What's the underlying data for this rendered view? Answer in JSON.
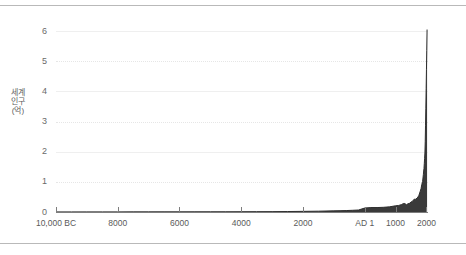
{
  "chart_data": {
    "type": "area",
    "title": "",
    "subtitle": "",
    "xlabel": "",
    "ylabel": "세계인구(억)",
    "xlim": [
      -10000,
      2050
    ],
    "ylim": [
      0,
      6.3
    ],
    "grid": true,
    "legend": "none",
    "fill_color": "#3a3a3a",
    "line_color": "#2f2f2f",
    "gridline_solid_color": "#efefef",
    "gridline_dotted_color": "#e6e6e6",
    "axis_color": "#7d7d7d",
    "y_ticks": [
      {
        "value": 0,
        "label": "0",
        "style": "none"
      },
      {
        "value": 1,
        "label": "1",
        "style": "dotted"
      },
      {
        "value": 2,
        "label": "2",
        "style": "solid"
      },
      {
        "value": 3,
        "label": "3",
        "style": "dotted"
      },
      {
        "value": 4,
        "label": "4",
        "style": "solid"
      },
      {
        "value": 5,
        "label": "5",
        "style": "dotted"
      },
      {
        "value": 6,
        "label": "6",
        "style": "solid"
      }
    ],
    "x_ticks": [
      {
        "value": -10000,
        "label": "10,000 BC"
      },
      {
        "value": -8000,
        "label": "8000"
      },
      {
        "value": -6000,
        "label": "6000"
      },
      {
        "value": -4000,
        "label": "4000"
      },
      {
        "value": -2000,
        "label": "2000"
      },
      {
        "value": 1,
        "label": "AD 1"
      },
      {
        "value": 1000,
        "label": "1000"
      },
      {
        "value": 2000,
        "label": "2000"
      }
    ],
    "x": [
      -10000,
      -9500,
      -9000,
      -8500,
      -8000,
      -7500,
      -7000,
      -6500,
      -6000,
      -5500,
      -5000,
      -4500,
      -4000,
      -3500,
      -3000,
      -2500,
      -2000,
      -1500,
      -1000,
      -800,
      -600,
      -400,
      -200,
      1,
      200,
      400,
      600,
      800,
      1000,
      1100,
      1200,
      1250,
      1300,
      1350,
      1400,
      1450,
      1500,
      1550,
      1600,
      1650,
      1700,
      1750,
      1800,
      1825,
      1850,
      1875,
      1900,
      1910,
      1920,
      1930,
      1940,
      1950,
      1960,
      1970,
      1980,
      1990,
      2000,
      2010,
      2020
    ],
    "values": [
      0.04,
      0.04,
      0.05,
      0.05,
      0.05,
      0.06,
      0.06,
      0.07,
      0.07,
      0.08,
      0.09,
      0.1,
      0.12,
      0.14,
      0.16,
      0.2,
      0.27,
      0.35,
      0.5,
      0.56,
      0.62,
      0.72,
      0.85,
      1.7,
      1.9,
      1.9,
      2.0,
      2.2,
      2.65,
      2.8,
      3.2,
      3.6,
      3.6,
      3.1,
      3.5,
      3.7,
      4.25,
      4.6,
      5.45,
      5.45,
      6.0,
      6.9,
      8.9,
      10.0,
      11.8,
      13.0,
      16.0,
      17.5,
      18.6,
      20.7,
      22.9,
      25.2,
      30.0,
      36.8,
      44.3,
      52.7,
      60.8,
      69.0,
      77.9
    ],
    "values_scale_note": "plotted in 억 (hundred millions), axis 0-6 corresponds to 0-60억 at final spike scaled to ~6"
  },
  "axis_display": {
    "y_max_label": "6",
    "y_min_label": "0"
  }
}
